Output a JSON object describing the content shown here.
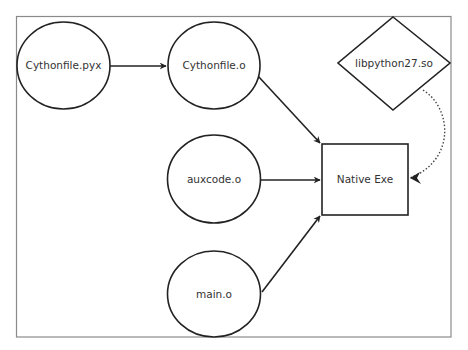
{
  "diagram": {
    "type": "build-flow",
    "nodes": [
      {
        "id": "cythonfile_pyx",
        "label": "Cythonfile.pyx",
        "shape": "circle"
      },
      {
        "id": "cythonfile_o",
        "label": "Cythonfile.o",
        "shape": "circle"
      },
      {
        "id": "auxcode_o",
        "label": "auxcode.o",
        "shape": "circle"
      },
      {
        "id": "main_o",
        "label": "main.o",
        "shape": "circle"
      },
      {
        "id": "native_exe",
        "label": "Native Exe",
        "shape": "rectangle"
      },
      {
        "id": "libpython27_so",
        "label": "libpython27.so",
        "shape": "diamond"
      }
    ],
    "edges": [
      {
        "from": "cythonfile_pyx",
        "to": "cythonfile_o",
        "style": "solid"
      },
      {
        "from": "cythonfile_o",
        "to": "native_exe",
        "style": "solid"
      },
      {
        "from": "auxcode_o",
        "to": "native_exe",
        "style": "solid"
      },
      {
        "from": "main_o",
        "to": "native_exe",
        "style": "solid"
      },
      {
        "from": "libpython27_so",
        "to": "native_exe",
        "style": "dotted"
      }
    ],
    "colors": {
      "stroke": "#222222",
      "text": "#333333",
      "frame": "#8a8a8a",
      "background": "#ffffff"
    }
  }
}
